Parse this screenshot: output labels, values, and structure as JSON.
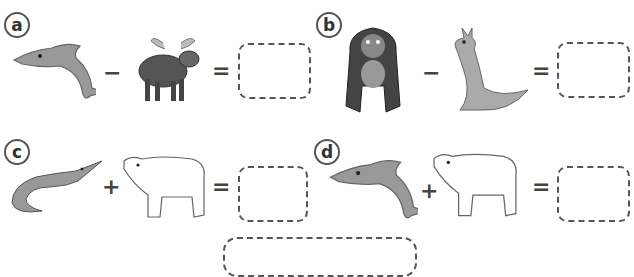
{
  "problems": [
    {
      "label": "a",
      "left": "dolphin",
      "operator": "−",
      "right": "moose",
      "equals": "="
    },
    {
      "label": "b",
      "left": "gorilla",
      "operator": "−",
      "right": "kangaroo",
      "equals": "="
    },
    {
      "label": "c",
      "left": "crocodile",
      "operator": "+",
      "right": "polar bear",
      "equals": "="
    },
    {
      "label": "d",
      "left": "dolphin",
      "operator": "+",
      "right": "polar bear",
      "equals": "="
    }
  ]
}
